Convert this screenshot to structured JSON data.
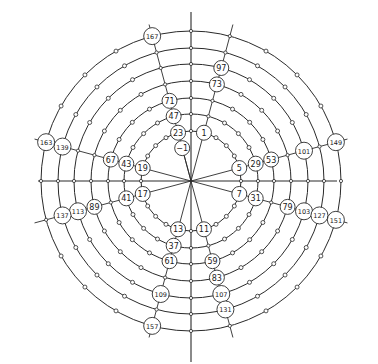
{
  "diagram": {
    "type": "prime-spiral-modulo-24",
    "center": [
      191,
      181
    ],
    "ring_radii": [
      50,
      67,
      83,
      100,
      117,
      133,
      150
    ],
    "inner_radius": 34,
    "modulus": 24,
    "angle_step_deg": 15,
    "axis": {
      "left": 38,
      "right": 337,
      "top": 12,
      "bottom": 362
    },
    "prime_residues": [
      1,
      5,
      7,
      11,
      13,
      17,
      19,
      23
    ],
    "dot_residues": [
      2,
      3,
      4,
      8,
      9,
      10,
      14,
      15,
      16,
      20,
      21,
      22
    ],
    "labels": [
      -1,
      1,
      5,
      7,
      11,
      13,
      17,
      19,
      23,
      29,
      31,
      37,
      41,
      43,
      47,
      53,
      59,
      61,
      67,
      71,
      73,
      79,
      83,
      89,
      97,
      101,
      103,
      107,
      109,
      113,
      127,
      131,
      137,
      139,
      149,
      151,
      157,
      163,
      167
    ],
    "colors": {
      "line": "#2a2a2a",
      "label_fill": "#ffffff",
      "text": "#1a1a1a"
    }
  }
}
